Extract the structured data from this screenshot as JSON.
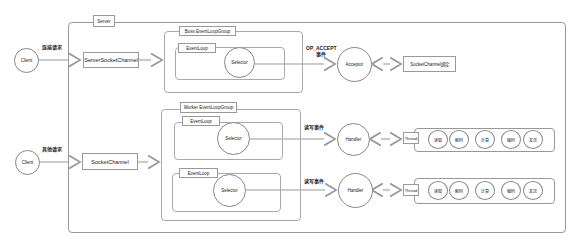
{
  "server": {
    "label": "Server"
  },
  "clients": [
    {
      "label": "Client",
      "request_label": "连接请求"
    },
    {
      "label": "Client",
      "request_label": "其他请求"
    }
  ],
  "channels": {
    "server_socket_channel": "ServerSocketChannel",
    "socket_channel": "SocketChannel"
  },
  "boss_group": {
    "label": "Boss EventLoopGroup",
    "event_loop": {
      "label": "EventLoop",
      "selector": "Selector"
    }
  },
  "accept": {
    "event_label_line1": "OP_ACCEPT",
    "event_label_line2": "事件",
    "acceptor": "Acceptor",
    "bind_label": "SocketChannel绑定"
  },
  "worker_group": {
    "label": "Worker EventLoopGroup",
    "event_loops": [
      {
        "label": "EventLoop",
        "selector": "Selector",
        "event_label": "读写事件",
        "handler": "Handler",
        "thread": "Thread",
        "steps": [
          "读取",
          "解码",
          "计算",
          "编码",
          "发送"
        ]
      },
      {
        "label": "EventLoop",
        "selector": "Selector",
        "event_label": "读写事件",
        "handler": "Handler",
        "thread": "Thread",
        "steps": [
          "读取",
          "解码",
          "计算",
          "编码",
          "发送"
        ]
      }
    ]
  }
}
